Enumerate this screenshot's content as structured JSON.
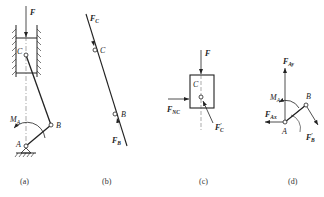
{
  "figure": {
    "panels": [
      {
        "id": "a",
        "caption": "(a)",
        "labels": {
          "force": "F",
          "point_c": "C",
          "point_b": "B",
          "point_a": "A",
          "moment": "M",
          "moment_sub": "A"
        }
      },
      {
        "id": "b",
        "caption": "(b)",
        "labels": {
          "force_c": "F",
          "force_c_sub": "C",
          "point_c": "C",
          "point_b": "B",
          "force_b": "F",
          "force_b_sub": "B"
        }
      },
      {
        "id": "c",
        "caption": "(c)",
        "labels": {
          "force": "F",
          "point_c": "C",
          "normal": "F",
          "normal_sub": "NC",
          "force_c": "F",
          "force_c_prime": "′",
          "force_c_sub": "C"
        }
      },
      {
        "id": "d",
        "caption": "(d)",
        "labels": {
          "force_ay": "F",
          "force_ay_sub": "Ay",
          "moment": "M",
          "moment_sub": "A",
          "force_ax": "F",
          "force_ax_sub": "Ax",
          "point_a": "A",
          "point_b": "B",
          "force_b": "F",
          "force_b_prime": "′",
          "force_b_sub": "B"
        }
      }
    ],
    "colors": {
      "ink": "#222222",
      "centerline": "#555555"
    }
  }
}
